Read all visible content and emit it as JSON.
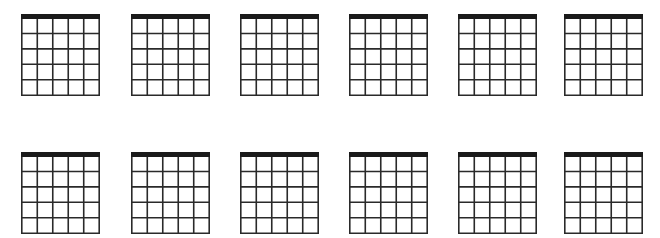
{
  "diagram": {
    "type": "blank-guitar-chord-charts",
    "rows": 2,
    "columns": 6,
    "strings_per_chart": 6,
    "frets_per_chart": 5,
    "line_color": "#2a2a2a",
    "nut_color": "#1a1a1a",
    "background": "#ffffff",
    "charts": [
      {
        "row": 1,
        "col": 1,
        "x": 21,
        "y": 14
      },
      {
        "row": 1,
        "col": 2,
        "x": 131,
        "y": 14
      },
      {
        "row": 1,
        "col": 3,
        "x": 240,
        "y": 14
      },
      {
        "row": 1,
        "col": 4,
        "x": 349,
        "y": 14
      },
      {
        "row": 1,
        "col": 5,
        "x": 458,
        "y": 14
      },
      {
        "row": 1,
        "col": 6,
        "x": 564,
        "y": 14
      },
      {
        "row": 2,
        "col": 1,
        "x": 21,
        "y": 152
      },
      {
        "row": 2,
        "col": 2,
        "x": 131,
        "y": 152
      },
      {
        "row": 2,
        "col": 3,
        "x": 240,
        "y": 152
      },
      {
        "row": 2,
        "col": 4,
        "x": 349,
        "y": 152
      },
      {
        "row": 2,
        "col": 5,
        "x": 458,
        "y": 152
      },
      {
        "row": 2,
        "col": 6,
        "x": 564,
        "y": 152
      }
    ]
  }
}
